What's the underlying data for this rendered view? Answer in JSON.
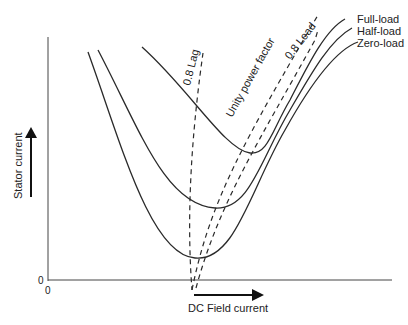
{
  "diagram": {
    "axes": {
      "y_label": "Stator current",
      "x_label": "DC Field current",
      "origin_y_label": "0",
      "origin_x_label": "0"
    },
    "curves": [
      {
        "name": "Full-load",
        "style": "solid"
      },
      {
        "name": "Half-load",
        "style": "solid"
      },
      {
        "name": "Zero-load",
        "style": "solid"
      }
    ],
    "power_factor_lines": [
      {
        "name": "0.8 Lag",
        "style": "dashed"
      },
      {
        "name": "Unity power factor",
        "style": "dashed"
      },
      {
        "name": "0.8 Lead",
        "style": "dashed"
      }
    ],
    "colors": {
      "line": "#2a2a2a",
      "background": "#ffffff"
    }
  }
}
